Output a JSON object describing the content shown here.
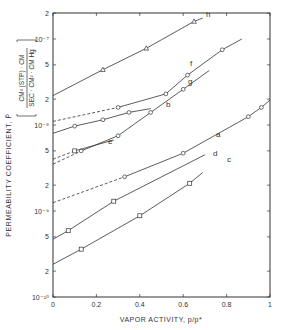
{
  "chart_data": {
    "type": "line",
    "title": "",
    "xlabel": "VAPOR ACTIVITY,  p/p*",
    "ylabel": "PERMEABILITY COEFFICIENT,  P̄",
    "ylabel_units_numerator": "CM³ (STP) · CM",
    "ylabel_units_denominator": "SEC · CM² · CM Hg",
    "xlim": [
      0,
      1
    ],
    "ylim": [
      1e-10,
      2e-07
    ],
    "yscale": "log",
    "grid": false,
    "x_ticks": [
      "0",
      "0.2",
      "0.4",
      "0.6",
      "0.8",
      "1"
    ],
    "y_ticks": [
      {
        "value": 2e-07,
        "label": "2"
      },
      {
        "value": 1e-07,
        "label": "10⁻⁷"
      },
      {
        "value": 5e-08,
        "label": "5"
      },
      {
        "value": 2e-08,
        "label": "2"
      },
      {
        "value": 1e-08,
        "label": "10⁻⁸"
      },
      {
        "value": 5e-09,
        "label": "5"
      },
      {
        "value": 2e-09,
        "label": "2"
      },
      {
        "value": 1e-09,
        "label": "10⁻⁹"
      },
      {
        "value": 5e-10,
        "label": "5"
      },
      {
        "value": 2e-10,
        "label": "2"
      },
      {
        "value": 1e-10,
        "label": "10⁻¹⁰"
      }
    ],
    "series": [
      {
        "name": "h",
        "marker": "triangle",
        "dash_x": [],
        "x": [
          0,
          0.23,
          0.43,
          0.65,
          0.69
        ],
        "y": [
          2.2e-08,
          4.4e-08,
          7.8e-08,
          1.6e-07,
          1.75e-07
        ]
      },
      {
        "name": "f",
        "marker": "circle",
        "dash_to": 0.3,
        "x": [
          0,
          0.3,
          0.52,
          0.62,
          0.78,
          0.87
        ],
        "y": [
          1.1e-08,
          1.6e-08,
          2.3e-08,
          3.8e-08,
          7.5e-08,
          1e-07
        ]
      },
      {
        "name": "g",
        "marker": "circle",
        "dash_to": 0.1,
        "x": [
          0,
          0.13,
          0.3,
          0.45,
          0.6,
          0.72
        ],
        "y": [
          3.5e-09,
          5e-09,
          7.5e-09,
          1.4e-08,
          2.6e-08,
          4.3e-08
        ]
      },
      {
        "name": "b",
        "marker": "circle",
        "x": [
          0,
          0.1,
          0.23,
          0.35,
          0.45
        ],
        "y": [
          8e-09,
          9.7e-09,
          1.15e-08,
          1.4e-08,
          1.55e-08
        ]
      },
      {
        "name": "e",
        "marker": "square",
        "dash_to": 0.1,
        "x": [
          0,
          0.1,
          0.28
        ],
        "y": [
          4e-09,
          5e-09,
          6.7e-09
        ]
      },
      {
        "name": "a",
        "marker": "circle",
        "dash_to": 0.3,
        "x": [
          0,
          0.33,
          0.6,
          0.9,
          0.96,
          1.0
        ],
        "y": [
          1.25e-09,
          2.5e-09,
          4.7e-09,
          1.25e-08,
          1.6e-08,
          1.95e-08
        ]
      },
      {
        "name": "d",
        "marker": "square",
        "x": [
          0,
          0.07,
          0.28,
          0.7
        ],
        "y": [
          4.7e-10,
          5.9e-10,
          1.3e-09,
          4.5e-09
        ]
      },
      {
        "name": "c",
        "marker": "square",
        "x": [
          0,
          0.13,
          0.4,
          0.63,
          0.69
        ],
        "y": [
          2.4e-10,
          3.6e-10,
          8.8e-10,
          2.1e-09,
          2.8e-09
        ]
      }
    ],
    "annotations": [
      "a",
      "b",
      "c",
      "d",
      "e",
      "f",
      "g",
      "h"
    ]
  }
}
